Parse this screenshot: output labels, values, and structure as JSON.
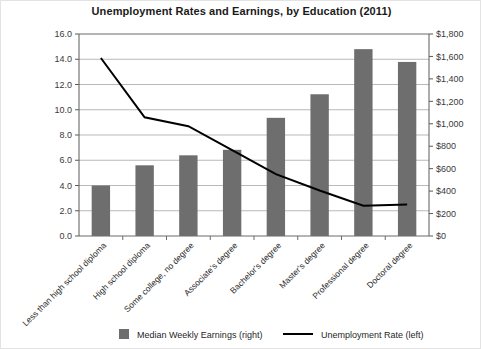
{
  "chart_data": {
    "type": "bar",
    "title": "Unemployment Rates and Earnings, by Education (2011)",
    "xlabel": "",
    "ylabel": "",
    "grid": true,
    "legend_position": "bottom",
    "categories": [
      "Less than high school diploma",
      "High school diploma",
      "Some college, no degree",
      "Associate's degree",
      "Bachelor's degree",
      "Master's degree",
      "Professional degree",
      "Doctoral degree"
    ],
    "series": [
      {
        "name": "Median Weekly Earnings (right)",
        "type": "bar",
        "axis": "right",
        "color": "#6e6e6e",
        "values": [
          450,
          630,
          719,
          768,
          1053,
          1263,
          1665,
          1551
        ]
      },
      {
        "name": "Unemployment Rate (left)",
        "type": "line",
        "axis": "left",
        "color": "#000000",
        "values": [
          14.1,
          9.4,
          8.7,
          6.8,
          4.9,
          3.6,
          2.4,
          2.5
        ]
      }
    ],
    "left_axis": {
      "label": "",
      "min": 0,
      "max": 16,
      "step": 2,
      "ticks": [
        "0.0",
        "2.0",
        "4.0",
        "6.0",
        "8.0",
        "10.0",
        "12.0",
        "14.0",
        "16.0"
      ]
    },
    "right_axis": {
      "label": "",
      "min": 0,
      "max": 1800,
      "step": 200,
      "ticks": [
        "$0",
        "$200",
        "$400",
        "$600",
        "$800",
        "$1,000",
        "$1,200",
        "$1,400",
        "$1,600",
        "$1,800"
      ]
    },
    "legend": [
      {
        "label": "Median Weekly Earnings (right)",
        "marker": "square",
        "color": "#6e6e6e"
      },
      {
        "label": "Unemployment Rate (left)",
        "marker": "line",
        "color": "#000000"
      }
    ]
  }
}
